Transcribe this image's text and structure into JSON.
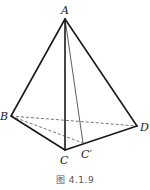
{
  "figure": {
    "caption": "图 4.1.9",
    "vertices": {
      "A": {
        "label": "A",
        "x": 65,
        "y": 19,
        "lx": 61,
        "ly": 14
      },
      "B": {
        "label": "B",
        "x": 11,
        "y": 116,
        "lx": 0,
        "ly": 120
      },
      "C": {
        "label": "C",
        "x": 65,
        "y": 150,
        "lx": 60,
        "ly": 164
      },
      "Cp": {
        "label": "C′",
        "x": 83,
        "y": 143,
        "lx": 81,
        "ly": 158
      },
      "D": {
        "label": "D",
        "x": 137,
        "y": 126,
        "lx": 140,
        "ly": 131
      }
    },
    "edges": [
      {
        "from": "A",
        "to": "B",
        "style": "solid"
      },
      {
        "from": "A",
        "to": "C",
        "style": "solid"
      },
      {
        "from": "A",
        "to": "D",
        "style": "solid"
      },
      {
        "from": "B",
        "to": "C",
        "style": "solid"
      },
      {
        "from": "C",
        "to": "D",
        "style": "solid"
      },
      {
        "from": "A",
        "to": "Cp",
        "style": "thin"
      },
      {
        "from": "B",
        "to": "D",
        "style": "dashed"
      },
      {
        "from": "B",
        "to": "Cp",
        "style": "dashed"
      }
    ]
  }
}
